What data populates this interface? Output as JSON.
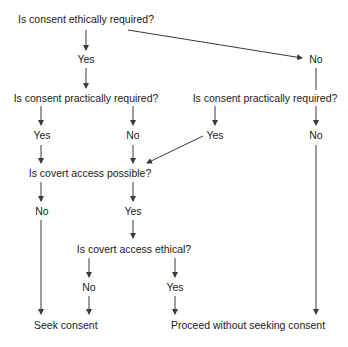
{
  "diagram": {
    "type": "decision-flowchart",
    "nodes": {
      "q_ethical": "Is consent ethically required?",
      "a_ethical_yes": "Yes",
      "a_ethical_no": "No",
      "q_practical_left": "Is consent practically required?",
      "q_practical_right": "Is consent practically required?",
      "a_pl_yes": "Yes",
      "a_pl_no": "No",
      "a_pr_yes": "Yes",
      "a_pr_no": "No",
      "q_covert_possible": "Is covert access possible?",
      "a_cp_no": "No",
      "a_cp_yes": "Yes",
      "q_covert_ethical": "Is covert access ethical?",
      "a_ce_no": "No",
      "a_ce_yes": "Yes",
      "outcome_seek": "Seek consent",
      "outcome_proceed": "Proceed without seeking consent"
    },
    "edges": [
      [
        "q_ethical",
        "a_ethical_yes"
      ],
      [
        "q_ethical",
        "a_ethical_no"
      ],
      [
        "a_ethical_yes",
        "q_practical_left"
      ],
      [
        "a_ethical_no",
        "q_practical_right"
      ],
      [
        "q_practical_left",
        "a_pl_yes"
      ],
      [
        "q_practical_left",
        "a_pl_no"
      ],
      [
        "q_practical_right",
        "a_pr_yes"
      ],
      [
        "q_practical_right",
        "a_pr_no"
      ],
      [
        "a_pl_yes",
        "q_covert_possible"
      ],
      [
        "a_pl_no",
        "q_covert_possible"
      ],
      [
        "a_pr_yes",
        "q_covert_possible"
      ],
      [
        "a_pr_no",
        "outcome_proceed"
      ],
      [
        "q_covert_possible",
        "a_cp_no"
      ],
      [
        "q_covert_possible",
        "a_cp_yes"
      ],
      [
        "a_cp_no",
        "outcome_seek"
      ],
      [
        "a_cp_yes",
        "q_covert_ethical"
      ],
      [
        "q_covert_ethical",
        "a_ce_no"
      ],
      [
        "q_covert_ethical",
        "a_ce_yes"
      ],
      [
        "a_ce_no",
        "outcome_seek"
      ],
      [
        "a_ce_yes",
        "outcome_proceed"
      ]
    ],
    "colors": {
      "line": "#3a3a3a",
      "text": "#1a1a1a",
      "background": "#ffffff"
    }
  }
}
